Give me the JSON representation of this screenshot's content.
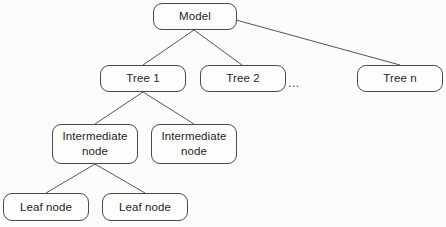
{
  "diagram": {
    "type": "tree-hierarchy",
    "background_color": "#fcfcfb",
    "node_border_color": "#4a4a4a",
    "node_fill_color": "#fdfdfc",
    "edge_color": "#555555",
    "text_color": "#1f1f1f",
    "nodes": [
      {
        "id": "model",
        "label": "Model",
        "level": 0,
        "x": 153,
        "y": 3,
        "w": 84,
        "h": 27
      },
      {
        "id": "tree1",
        "label": "Tree 1",
        "level": 1,
        "x": 100,
        "y": 65,
        "w": 86,
        "h": 27
      },
      {
        "id": "tree2",
        "label": "Tree 2",
        "level": 1,
        "x": 200,
        "y": 65,
        "w": 86,
        "h": 27
      },
      {
        "id": "treen",
        "label": "Tree n",
        "level": 1,
        "x": 357,
        "y": 65,
        "w": 86,
        "h": 27
      },
      {
        "id": "inter1",
        "label": "Intermediate\nnode",
        "level": 2,
        "x": 52,
        "y": 124,
        "w": 86,
        "h": 40
      },
      {
        "id": "inter2",
        "label": "Intermediate\nnode",
        "level": 2,
        "x": 151,
        "y": 124,
        "w": 86,
        "h": 40
      },
      {
        "id": "leaf1",
        "label": "Leaf node",
        "level": 3,
        "x": 3,
        "y": 193,
        "w": 86,
        "h": 28
      },
      {
        "id": "leaf2",
        "label": "Leaf node",
        "level": 3,
        "x": 102,
        "y": 193,
        "w": 86,
        "h": 28
      }
    ],
    "ellipsis": {
      "label": "...",
      "x": 288,
      "y": 77
    },
    "edges": [
      {
        "from": "model",
        "to": "tree1",
        "x1": 194,
        "y1": 30,
        "x2": 143,
        "y2": 65
      },
      {
        "from": "model",
        "to": "tree2",
        "x1": 194,
        "y1": 30,
        "x2": 242,
        "y2": 65
      },
      {
        "from": "model",
        "to": "treen",
        "x1": 236,
        "y1": 20,
        "x2": 400,
        "y2": 65
      },
      {
        "from": "tree1",
        "to": "inter1",
        "x1": 143,
        "y1": 92,
        "x2": 95,
        "y2": 124
      },
      {
        "from": "tree1",
        "to": "inter2",
        "x1": 143,
        "y1": 92,
        "x2": 194,
        "y2": 124
      },
      {
        "from": "inter1",
        "to": "leaf1",
        "x1": 95,
        "y1": 164,
        "x2": 46,
        "y2": 193
      },
      {
        "from": "inter1",
        "to": "leaf2",
        "x1": 95,
        "y1": 164,
        "x2": 145,
        "y2": 193
      }
    ]
  }
}
